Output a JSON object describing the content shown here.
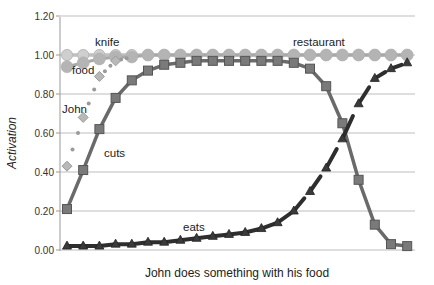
{
  "chart_data": {
    "type": "line",
    "title": "",
    "xlabel": "John does something with his food",
    "ylabel": "Activation",
    "ylim": [
      0,
      1.2
    ],
    "yticks": [
      "0.00",
      "0.20",
      "0.40",
      "0.60",
      "0.80",
      "1.00",
      "1.20"
    ],
    "grid": true,
    "legend": "none (inline labels)",
    "x": [
      1,
      2,
      3,
      4,
      5,
      6,
      7,
      8,
      9,
      10,
      11,
      12,
      13,
      14,
      15,
      16,
      17,
      18,
      19,
      20,
      21,
      22
    ],
    "series": [
      {
        "name": "knife",
        "marker": "circle",
        "color": "#b8b8b8",
        "values": [
          1.0,
          1.0,
          1.0,
          1.0,
          1.0,
          1.0,
          1.0,
          1.0,
          1.0,
          1.0,
          1.0,
          1.0,
          1.0,
          1.0,
          1.0,
          1.0,
          1.0,
          1.0,
          1.0,
          1.0,
          1.0,
          1.0
        ]
      },
      {
        "name": "restaurant",
        "marker": "circle",
        "color": "#c4c4c4",
        "values": [
          1.0,
          1.0,
          1.0,
          1.0,
          1.0,
          1.0,
          1.0,
          1.0,
          1.0,
          1.0,
          1.0,
          1.0,
          1.0,
          1.0,
          1.0,
          1.0,
          1.0,
          1.0,
          1.0,
          1.0,
          1.0,
          1.0
        ]
      },
      {
        "name": "food",
        "marker": "circle",
        "color": "#aaaaaa",
        "values": [
          0.94,
          0.96,
          0.98,
          0.99,
          0.99,
          1.0,
          1.0,
          1.0,
          1.0,
          1.0,
          1.0,
          1.0,
          1.0,
          1.0,
          1.0,
          1.0,
          1.0,
          1.0,
          1.0,
          1.0,
          1.0,
          1.0
        ]
      },
      {
        "name": "John",
        "marker": "diamond",
        "color": "#a0a0a0",
        "values": [
          0.43,
          0.68,
          0.89,
          0.97,
          0.99,
          1.0,
          1.0,
          1.0,
          1.0,
          1.0,
          1.0,
          1.0,
          1.0,
          1.0,
          1.0,
          1.0,
          1.0,
          1.0,
          1.0,
          1.0,
          1.0,
          1.0
        ]
      },
      {
        "name": "cuts",
        "marker": "square",
        "color": "#6e6e6e",
        "values": [
          0.21,
          0.41,
          0.62,
          0.78,
          0.87,
          0.92,
          0.95,
          0.96,
          0.97,
          0.97,
          0.97,
          0.97,
          0.97,
          0.97,
          0.96,
          0.93,
          0.84,
          0.65,
          0.36,
          0.13,
          0.03,
          0.02
        ]
      },
      {
        "name": "eats",
        "marker": "triangle",
        "color": "#333333",
        "values": [
          0.02,
          0.02,
          0.02,
          0.03,
          0.03,
          0.04,
          0.04,
          0.05,
          0.06,
          0.07,
          0.08,
          0.09,
          0.11,
          0.14,
          0.2,
          0.3,
          0.42,
          0.57,
          0.75,
          0.88,
          0.93,
          0.96
        ]
      }
    ],
    "annotations": [
      {
        "text": "knife",
        "x_px": 95,
        "y_px": 46
      },
      {
        "text": "restaurant",
        "x_px": 293,
        "y_px": 46
      },
      {
        "text": "food",
        "x_px": 72,
        "y_px": 73
      },
      {
        "text": "John",
        "x_px": 62,
        "y_px": 112
      },
      {
        "text": "cuts",
        "x_px": 104,
        "y_px": 157
      },
      {
        "text": "eats",
        "x_px": 183,
        "y_px": 230
      }
    ]
  },
  "labels": {
    "xlabel": "John does something with his food",
    "ylabel": "Activation",
    "knife": "knife",
    "restaurant": "restaurant",
    "food": "food",
    "john": "John",
    "cuts": "cuts",
    "eats": "eats"
  }
}
